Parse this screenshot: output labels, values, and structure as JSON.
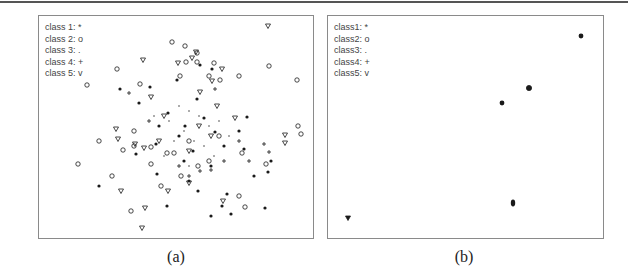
{
  "figure": {
    "panels": [
      {
        "caption": "(a)",
        "legend": [
          "class 1: *",
          "class 2: o",
          "class 3: .",
          "class 4: +",
          "class 5: v"
        ]
      },
      {
        "caption": "(b)",
        "legend": [
          "class1: *",
          "class2: o",
          "class3: .",
          "class4: +",
          "class5: v"
        ]
      }
    ]
  },
  "chart_data": [
    {
      "type": "scatter",
      "title": "(a)",
      "description": "Overlapping 2D embedding of five classes; points densely mixed around center",
      "legend": [
        "class 1: *",
        "class 2: o",
        "class 3: .",
        "class 4: +",
        "class 5: v"
      ],
      "axes": "none",
      "grid": false,
      "note": "coordinates in panel pixels (0-276 x, 0-224 y, origin top-left)",
      "series": [
        {
          "name": "class 1",
          "marker": "*",
          "points": [
            [
              161,
              49
            ],
            [
              138,
              64
            ],
            [
              81,
              73
            ],
            [
              100,
              87
            ],
            [
              173,
              53
            ],
            [
              111,
              71
            ],
            [
              158,
              83
            ],
            [
              129,
              97
            ],
            [
              208,
              101
            ],
            [
              146,
              110
            ],
            [
              176,
              116
            ],
            [
              117,
              128
            ],
            [
              97,
              138
            ],
            [
              154,
              135
            ],
            [
              185,
              130
            ],
            [
              205,
              133
            ],
            [
              215,
              160
            ],
            [
              60,
              170
            ],
            [
              118,
              158
            ],
            [
              150,
              165
            ],
            [
              172,
              150
            ],
            [
              232,
              145
            ],
            [
              188,
              178
            ],
            [
              128,
              190
            ],
            [
              159,
              175
            ],
            [
              183,
              190
            ],
            [
              192,
              198
            ],
            [
              172,
              200
            ],
            [
              226,
              192
            ],
            [
              229,
              156
            ],
            [
              140,
              120
            ],
            [
              120,
              110
            ],
            [
              165,
              102
            ],
            [
              145,
              145
            ],
            [
              200,
              115
            ]
          ]
        },
        {
          "name": "class 2",
          "marker": "o",
          "points": [
            [
              133,
              26
            ],
            [
              146,
              30
            ],
            [
              158,
              37
            ],
            [
              147,
              46
            ],
            [
              158,
              46
            ],
            [
              175,
              47
            ],
            [
              141,
              60
            ],
            [
              170,
              60
            ],
            [
              181,
              64
            ],
            [
              230,
              50
            ],
            [
              258,
              64
            ],
            [
              48,
              69
            ],
            [
              78,
              53
            ],
            [
              101,
              68
            ],
            [
              227,
              148
            ],
            [
              259,
              110
            ],
            [
              262,
              118
            ],
            [
              39,
              148
            ],
            [
              60,
              125
            ],
            [
              84,
              134
            ],
            [
              95,
              130
            ],
            [
              112,
              131
            ],
            [
              135,
              137
            ],
            [
              159,
              150
            ],
            [
              170,
              145
            ],
            [
              203,
              137
            ],
            [
              128,
              137
            ],
            [
              200,
              180
            ],
            [
              206,
              191
            ],
            [
              92,
              195
            ],
            [
              112,
              148
            ],
            [
              122,
              170
            ],
            [
              142,
              160
            ],
            [
              95,
              115
            ],
            [
              150,
              125
            ],
            [
              180,
              120
            ],
            [
              73,
              160
            ],
            [
              200,
              60
            ]
          ]
        },
        {
          "name": "class 3",
          "marker": ".",
          "points": [
            [
              140,
              90
            ],
            [
              150,
              95
            ],
            [
              160,
              100
            ],
            [
              130,
              105
            ],
            [
              170,
              110
            ],
            [
              145,
              115
            ],
            [
              155,
              125
            ],
            [
              165,
              130
            ],
            [
              135,
              125
            ],
            [
              175,
              140
            ],
            [
              125,
              140
            ],
            [
              150,
              150
            ],
            [
              180,
              105
            ],
            [
              190,
              120
            ],
            [
              115,
              100
            ]
          ]
        },
        {
          "name": "class 4",
          "marker": "+",
          "points": [
            [
              90,
              77
            ],
            [
              176,
              73
            ],
            [
              225,
              128
            ],
            [
              230,
              136
            ],
            [
              172,
              154
            ],
            [
              150,
              160
            ],
            [
              161,
              155
            ],
            [
              110,
              105
            ],
            [
              200,
              125
            ],
            [
              140,
              150
            ],
            [
              185,
              145
            ],
            [
              210,
              145
            ]
          ]
        },
        {
          "name": "class 5",
          "marker": "v",
          "points": [
            [
              229,
              10
            ],
            [
              157,
              36
            ],
            [
              153,
              42
            ],
            [
              139,
              47
            ],
            [
              183,
              53
            ],
            [
              173,
              65
            ],
            [
              161,
              76
            ],
            [
              104,
              44
            ],
            [
              77,
              113
            ],
            [
              112,
              81
            ],
            [
              79,
              123
            ],
            [
              96,
              128
            ],
            [
              246,
              119
            ],
            [
              246,
              127
            ],
            [
              105,
              132
            ],
            [
              82,
              175
            ],
            [
              129,
              175
            ],
            [
              150,
              167
            ],
            [
              184,
              185
            ],
            [
              106,
              192
            ],
            [
              103,
              212
            ],
            [
              120,
              125
            ],
            [
              150,
              135
            ],
            [
              172,
              120
            ],
            [
              196,
              102
            ],
            [
              125,
              100
            ],
            [
              160,
              110
            ],
            [
              178,
              90
            ]
          ]
        }
      ]
    },
    {
      "type": "scatter",
      "title": "(b)",
      "description": "Well-separated 2D embedding; each class collapses to a tight cluster",
      "legend": [
        "class1: *",
        "class2: o",
        "class3: .",
        "class4: +",
        "class5: v"
      ],
      "axes": "none",
      "grid": false,
      "note": "coordinates in panel pixels (0-277 x, 0-224 y, origin top-left)",
      "series": [
        {
          "name": "class1",
          "marker": "*",
          "points": [
            [
              174,
              87
            ]
          ]
        },
        {
          "name": "class2",
          "marker": "o",
          "points": [
            [
              201,
              72
            ]
          ]
        },
        {
          "name": "class3",
          "marker": ".",
          "points": [
            [
              185,
              187
            ]
          ]
        },
        {
          "name": "class4",
          "marker": "+",
          "points": [
            [
              174,
              87
            ]
          ]
        },
        {
          "name": "class5",
          "marker": "v",
          "points": [
            [
              20,
              202
            ]
          ]
        },
        {
          "name": "outlier",
          "marker": "*",
          "points": [
            [
              253,
              20
            ]
          ]
        }
      ]
    }
  ]
}
